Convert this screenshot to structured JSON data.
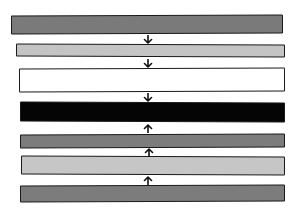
{
  "diagram": {
    "type": "layer-stack",
    "layers": [
      {
        "id": 1,
        "fill": "#7a7a7a",
        "shade": "medium-gray",
        "x": 11,
        "y": 15,
        "w": 272,
        "h": 19
      },
      {
        "id": 2,
        "fill": "#c4c4c4",
        "shade": "light-gray",
        "x": 16,
        "y": 44,
        "w": 269,
        "h": 13
      },
      {
        "id": 3,
        "fill": "#ffffff",
        "shade": "white",
        "x": 19,
        "y": 68,
        "w": 266,
        "h": 24
      },
      {
        "id": 4,
        "fill": "#050505",
        "shade": "black",
        "x": 20,
        "y": 102,
        "w": 265,
        "h": 20
      },
      {
        "id": 5,
        "fill": "#7c7c7c",
        "shade": "medium-gray",
        "x": 20,
        "y": 134,
        "w": 265,
        "h": 14
      },
      {
        "id": 6,
        "fill": "#c6c6c6",
        "shade": "light-gray",
        "x": 21,
        "y": 156,
        "w": 264,
        "h": 19
      },
      {
        "id": 7,
        "fill": "#7c7c7c",
        "shade": "medium-gray",
        "x": 20,
        "y": 185,
        "w": 265,
        "h": 17
      }
    ],
    "arrows": [
      {
        "direction": "down",
        "x": 143,
        "y": 35
      },
      {
        "direction": "down",
        "x": 143,
        "y": 59
      },
      {
        "direction": "down",
        "x": 143,
        "y": 93
      },
      {
        "direction": "up",
        "x": 143,
        "y": 124
      },
      {
        "direction": "up",
        "x": 144,
        "y": 148
      },
      {
        "direction": "up",
        "x": 143,
        "y": 176
      }
    ]
  }
}
